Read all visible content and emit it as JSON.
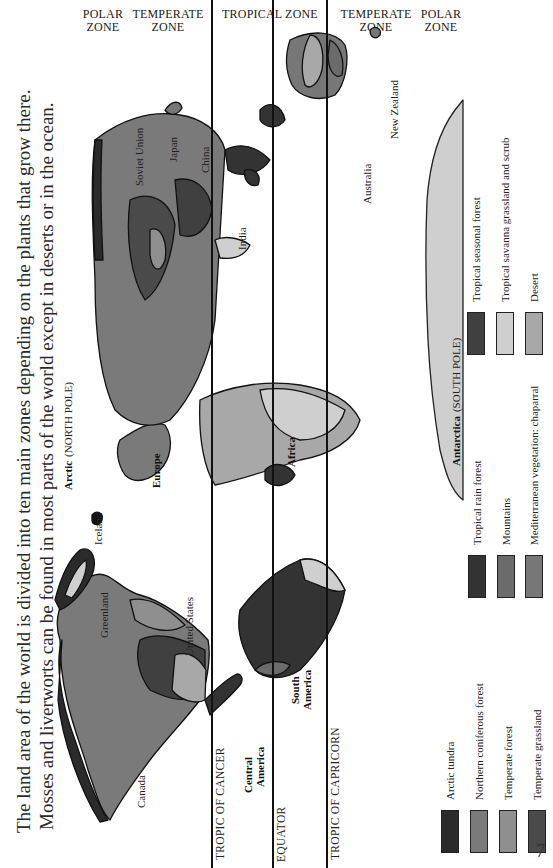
{
  "intro": {
    "line1": "The land area of the world is divided into ten main zones depending on the plants that grow there.",
    "line2": "Mosses and liverworts can be found in most parts of the world except in deserts or in the ocean."
  },
  "zones": [
    {
      "label": "POLAR ZONE",
      "line1": "POLAR",
      "line2": "ZONE"
    },
    {
      "label": "TEMPERATE ZONE",
      "line1": "TEMPERATE",
      "line2": "ZONE"
    },
    {
      "label": "TROPICAL ZONE",
      "line1": "TROPICAL ZONE",
      "line2": ""
    },
    {
      "label": "TEMPERATE ZONE",
      "line1": "TEMPERATE",
      "line2": "ZONE"
    },
    {
      "label": "POLAR ZONE",
      "line1": "POLAR",
      "line2": "ZONE"
    }
  ],
  "lines": {
    "tropic_cancer": "TROPIC OF CANCER",
    "equator": "EQUATOR",
    "tropic_capricorn": "TROPIC OF CAPRICORN"
  },
  "regions": {
    "arctic": "Arctic",
    "arctic_sub": "(NORTH POLE)",
    "antarctica": "Antarctica",
    "antarctica_sub": "(SOUTH POLE)",
    "canada": "Canada",
    "greenland": "Greenland",
    "iceland": "Iceland",
    "united_states": "United States",
    "central_america_1": "Central",
    "central_america_2": "America",
    "south_america_1": "South",
    "south_america_2": "America",
    "europe": "Europe",
    "africa": "Africa",
    "soviet_union": "Soviet Union",
    "japan": "Japan",
    "china": "China",
    "india": "India",
    "australia": "Australia",
    "new_zealand": "New Zealand"
  },
  "legend": [
    {
      "label": "Arctic tundra",
      "color": "#2b2b2b"
    },
    {
      "label": "Northern coniferous forest",
      "color": "#7a7a7a"
    },
    {
      "label": "Temperate forest",
      "color": "#8f8f8f"
    },
    {
      "label": "Temperate grassland",
      "color": "#4a4a4a"
    },
    {
      "label": "Tropical rain forest",
      "color": "#333333"
    },
    {
      "label": "Mountains",
      "color": "#6b6b6b"
    },
    {
      "label": "Mediterranean vegetation: chaparral",
      "color": "#777777"
    },
    {
      "label": "Tropical seasonal forest",
      "color": "#404040"
    },
    {
      "label": "Tropical savanna grassland and scrub",
      "color": "#cfcfcf"
    },
    {
      "label": "Desert",
      "color": "#a8a8a8"
    }
  ],
  "page_number": "7"
}
